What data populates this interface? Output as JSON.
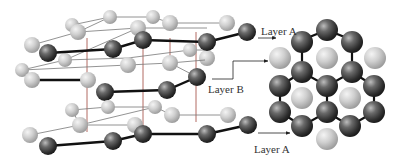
{
  "labels": {
    "top": "Layer A",
    "middle": "Layer B",
    "bottom": "Layer A"
  },
  "colors": {
    "dark_sphere": "#3a3a3a",
    "light_sphere": "#c8c8c8",
    "bond": "#111111",
    "grid_line": "#777777",
    "vertical_line": "#a0443a",
    "text": "#333333"
  }
}
